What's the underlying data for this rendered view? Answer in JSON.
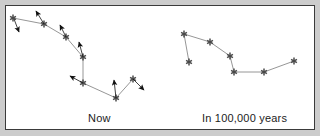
{
  "figure": {
    "kind": "constellation-proper-motion-diagram",
    "background_color": "#ffffff",
    "frame_color": "#3a3a3a",
    "margin_color": "#cccccc",
    "star_color": "#4a4a4a",
    "link_color": "#8a8a8a",
    "arrow_color": "#111111"
  },
  "panels": {
    "left": {
      "label": "Now",
      "label_position": {
        "x": 82,
        "y": 106
      },
      "stars": [
        {
          "name": "star-1",
          "x": 13,
          "y": 18
        },
        {
          "name": "star-2",
          "x": 44,
          "y": 24
        },
        {
          "name": "star-3",
          "x": 66,
          "y": 37
        },
        {
          "name": "star-4",
          "x": 83,
          "y": 57
        },
        {
          "name": "star-5",
          "x": 83,
          "y": 83
        },
        {
          "name": "star-6",
          "x": 116,
          "y": 98
        },
        {
          "name": "star-7",
          "x": 133,
          "y": 79
        }
      ],
      "links": [
        {
          "from": 0,
          "to": 1
        },
        {
          "from": 1,
          "to": 2
        },
        {
          "from": 2,
          "to": 3
        },
        {
          "from": 3,
          "to": 4
        },
        {
          "from": 4,
          "to": 5
        },
        {
          "from": 5,
          "to": 6
        }
      ],
      "motion_arrows": [
        {
          "name": "arrow-star-1",
          "x1": 14,
          "y1": 19,
          "x2": 19,
          "y2": 32
        },
        {
          "name": "arrow-star-2",
          "x1": 44,
          "y1": 24,
          "x2": 36,
          "y2": 11
        },
        {
          "name": "arrow-star-3",
          "x1": 66,
          "y1": 37,
          "x2": 60,
          "y2": 25
        },
        {
          "name": "arrow-star-4",
          "x1": 83,
          "y1": 57,
          "x2": 79,
          "y2": 42
        },
        {
          "name": "arrow-star-5",
          "x1": 83,
          "y1": 83,
          "x2": 70,
          "y2": 76
        },
        {
          "name": "arrow-star-6",
          "x1": 116,
          "y1": 98,
          "x2": 114,
          "y2": 80
        },
        {
          "name": "arrow-star-7",
          "x1": 133,
          "y1": 79,
          "x2": 144,
          "y2": 90
        }
      ]
    },
    "right": {
      "label": "In 100,000 years",
      "label_position": {
        "x": 196,
        "y": 106
      },
      "stars": [
        {
          "name": "star-1",
          "x": 184,
          "y": 34
        },
        {
          "name": "star-2",
          "x": 189,
          "y": 62
        },
        {
          "name": "star-3",
          "x": 210,
          "y": 42
        },
        {
          "name": "star-4",
          "x": 230,
          "y": 56
        },
        {
          "name": "star-5",
          "x": 234,
          "y": 72
        },
        {
          "name": "star-6",
          "x": 264,
          "y": 72
        },
        {
          "name": "star-7",
          "x": 294,
          "y": 61
        }
      ],
      "links": [
        {
          "from": 0,
          "to": 1
        },
        {
          "from": 0,
          "to": 2
        },
        {
          "from": 2,
          "to": 3
        },
        {
          "from": 3,
          "to": 4
        },
        {
          "from": 4,
          "to": 5
        },
        {
          "from": 5,
          "to": 6
        }
      ],
      "motion_arrows": []
    }
  }
}
